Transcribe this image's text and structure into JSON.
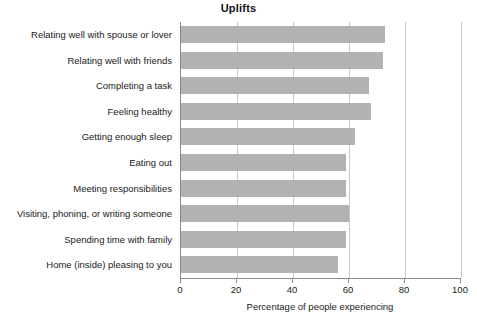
{
  "chart_data": {
    "type": "bar",
    "orientation": "horizontal",
    "title": "Uplifts",
    "xlabel": "Percentage of people experiencing",
    "ylabel": "",
    "xlim": [
      0,
      100
    ],
    "xticks": [
      0,
      20,
      40,
      60,
      80,
      100
    ],
    "xtick_labels": [
      "0",
      "20",
      "40",
      "60",
      "80",
      "100"
    ],
    "grid": "vertical",
    "legend": "none",
    "bar_color": "#b2b2b2",
    "axis_color": "#8a8a8a",
    "gridline_color": "#c9c9c9",
    "categories": [
      "Relating well with spouse or lover",
      "Relating well with friends",
      "Completing a task",
      "Feeling healthy",
      "Getting enough sleep",
      "Eating out",
      "Meeting responsibilities",
      "Visiting, phoning, or writing someone",
      "Spending time with family",
      "Home (inside) pleasing to you"
    ],
    "values": [
      73,
      72,
      67,
      68,
      62,
      59,
      59,
      60,
      59,
      56
    ]
  }
}
